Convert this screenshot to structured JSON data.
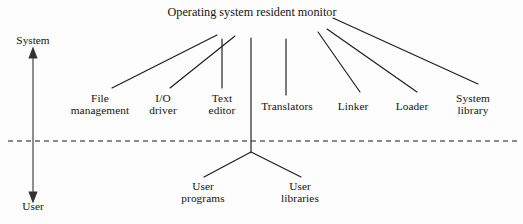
{
  "diagram": {
    "type": "tree-hierarchy",
    "title": {
      "line1": "Operating system resident",
      "line2": "monitor",
      "x": 252,
      "y": 6
    },
    "axis": {
      "name": "system-user-axis",
      "top_label": "System",
      "bottom_label": "User",
      "x": 33,
      "top_y": 54,
      "bottom_y": 196,
      "top_label_y": 36,
      "bottom_label_y": 198
    },
    "boundary": {
      "name": "system-user-boundary",
      "style": "dashed",
      "y": 141,
      "x1": 8,
      "x2": 517
    },
    "system_nodes": [
      {
        "id": "file-management",
        "line1": "File",
        "line2": "management",
        "x": 100,
        "y": 92,
        "connector": "diagonal"
      },
      {
        "id": "io-driver",
        "line1": "I/O",
        "line2": "driver",
        "x": 163,
        "y": 92,
        "connector": "diagonal"
      },
      {
        "id": "text-editor",
        "line1": "Text",
        "line2": "editor",
        "x": 222,
        "y": 92,
        "connector": "vertical"
      },
      {
        "id": "translators",
        "line1": "Translators",
        "line2": "",
        "x": 287,
        "y": 100,
        "connector": "vertical"
      },
      {
        "id": "linker",
        "line1": "Linker",
        "line2": "",
        "x": 353,
        "y": 100,
        "connector": "diagonal"
      },
      {
        "id": "loader",
        "line1": "Loader",
        "line2": "",
        "x": 412,
        "y": 100,
        "connector": "diagonal"
      },
      {
        "id": "system-library",
        "line1": "System",
        "line2": "library",
        "x": 473,
        "y": 92,
        "connector": "diagonal"
      }
    ],
    "user_nodes": [
      {
        "id": "user-programs",
        "line1": "User",
        "line2": "programs",
        "x": 203,
        "y": 180
      },
      {
        "id": "user-libraries",
        "line1": "User",
        "line2": "libraries",
        "x": 300,
        "y": 180
      }
    ],
    "hub": {
      "x": 251,
      "top_y": 38,
      "bottom_y": 152
    },
    "colors": {
      "line": "#1b1b1b",
      "text": "#141414",
      "background": "#fdfdfd"
    }
  }
}
